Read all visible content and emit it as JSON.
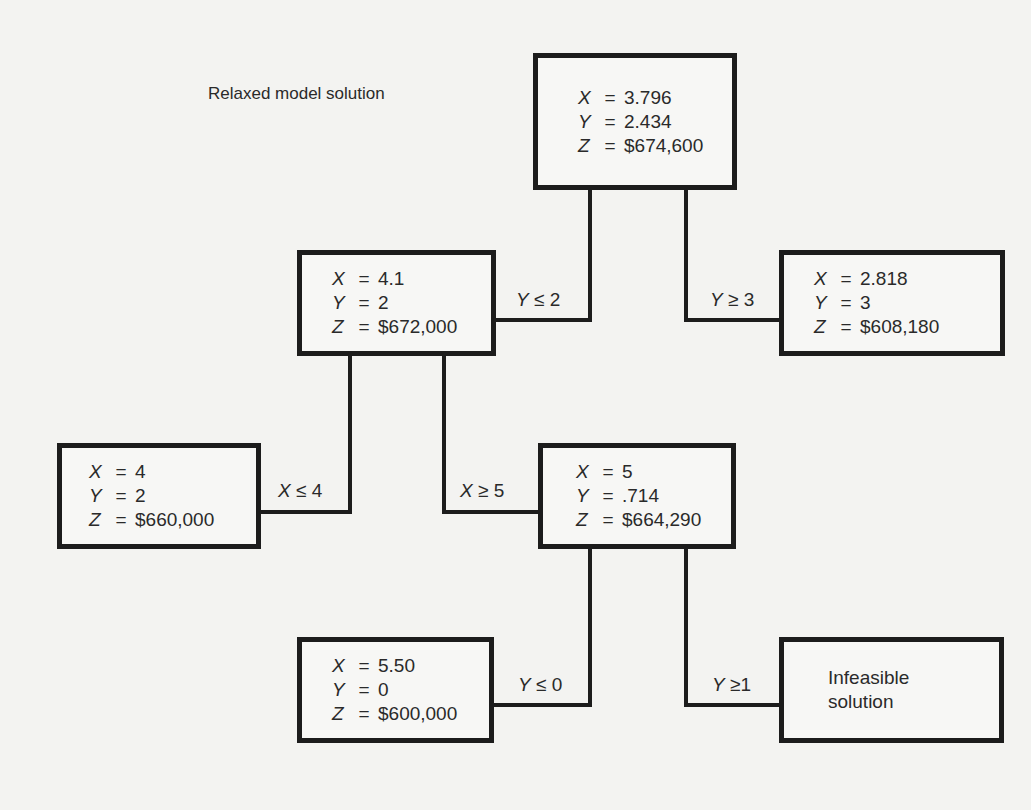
{
  "caption": "Relaxed model solution",
  "nodes": {
    "root": {
      "x_label": "X",
      "x": "3.796",
      "y_label": "Y",
      "y": "2.434",
      "z_label": "Z",
      "z": "$674,600",
      "eq": "="
    },
    "n1": {
      "x_label": "X",
      "x": "4.1",
      "y_label": "Y",
      "y": "2",
      "z_label": "Z",
      "z": "$672,000",
      "eq": "="
    },
    "n2": {
      "x_label": "X",
      "x": "2.818",
      "y_label": "Y",
      "y": "3",
      "z_label": "Z",
      "z": "$608,180",
      "eq": "="
    },
    "n3": {
      "x_label": "X",
      "x": "4",
      "y_label": "Y",
      "y": "2",
      "z_label": "Z",
      "z": "$660,000",
      "eq": "="
    },
    "n4": {
      "x_label": "X",
      "x": "5",
      "y_label": "Y",
      "y": ".714",
      "z_label": "Z",
      "z": "$664,290",
      "eq": "="
    },
    "n5": {
      "x_label": "X",
      "x": "5.50",
      "y_label": "Y",
      "y": "0",
      "z_label": "Z",
      "z": "$600,000",
      "eq": "="
    },
    "n6": {
      "line1": "Infeasible",
      "line2": "solution"
    }
  },
  "branches": {
    "root_left": {
      "var": "Y",
      "op": "≤",
      "val": "2"
    },
    "root_right": {
      "var": "Y",
      "op": "≥",
      "val": "3"
    },
    "n1_left": {
      "var": "X",
      "op": "≤",
      "val": "4"
    },
    "n1_right": {
      "var": "X",
      "op": "≥",
      "val": "5"
    },
    "n4_left": {
      "var": "Y",
      "op": "≤",
      "val": "0"
    },
    "n4_right": {
      "var": "Y",
      "op": "≥",
      "val": "1"
    }
  }
}
